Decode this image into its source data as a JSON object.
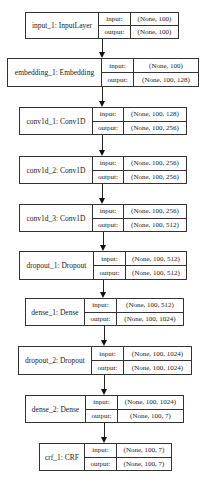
{
  "diagram": {
    "type": "keras_model_plot",
    "port_labels": {
      "input": "input:",
      "output": "output:"
    },
    "nodes": [
      {
        "name": "input_1: InputLayer",
        "input": "(None, 100)",
        "output": "(None, 100)"
      },
      {
        "name": "embedding_1: Embedding",
        "input": "(None, 100)",
        "output": "(None, 100, 128)"
      },
      {
        "name": "conv1d_1: Conv1D",
        "input": "(None, 100, 128)",
        "output": "(None, 100, 256)"
      },
      {
        "name": "conv1d_2: Conv1D",
        "input": "(None, 100, 256)",
        "output": "(None, 100, 256)"
      },
      {
        "name": "conv1d_3: Conv1D",
        "input": "(None, 100, 256)",
        "output": "(None, 100, 512)"
      },
      {
        "name": "dropout_1: Dropout",
        "input": "(None, 100, 512)",
        "output": "(None, 100, 512)"
      },
      {
        "name": "dense_1: Dense",
        "input": "(None, 100, 512)",
        "output": "(None, 100, 1024)"
      },
      {
        "name": "dropout_2: Dropout",
        "input": "(None, 100, 1024)",
        "output": "(None, 100, 1024)"
      },
      {
        "name": "dense_2: Dense",
        "input": "(None, 100, 1024)",
        "output": "(None, 100, 7)"
      },
      {
        "name": "crf_1: CRF",
        "input": "(None, 100, 7)",
        "output": "(None, 100, 7)"
      }
    ],
    "edges": [
      [
        "input_1",
        "embedding_1"
      ],
      [
        "embedding_1",
        "conv1d_1"
      ],
      [
        "conv1d_1",
        "conv1d_2"
      ],
      [
        "conv1d_2",
        "conv1d_3"
      ],
      [
        "conv1d_3",
        "dropout_1"
      ],
      [
        "dropout_1",
        "dense_1"
      ],
      [
        "dense_1",
        "dropout_2"
      ],
      [
        "dropout_2",
        "dense_2"
      ],
      [
        "dense_2",
        "crf_1"
      ]
    ]
  }
}
